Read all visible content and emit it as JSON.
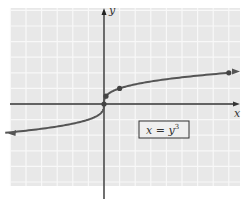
{
  "chart_data": {
    "type": "line",
    "title": "",
    "xlabel": "x",
    "ylabel": "y",
    "equation_label": "x = y³",
    "equation_lhs": "x = y",
    "equation_exp": "3",
    "grid": true,
    "xlim": [
      -6.3,
      8.6
    ],
    "ylim": [
      -5.3,
      6.1
    ],
    "series": [
      {
        "name": "x = y^3",
        "points": [
          {
            "x": 0,
            "y": 0
          },
          {
            "x": 0.125,
            "y": 0.5
          },
          {
            "x": 1,
            "y": 1
          },
          {
            "x": 8,
            "y": 2
          }
        ]
      }
    ],
    "colors": {
      "grid_bg": "#e8e8e8",
      "grid_line": "#f7f7f7",
      "curve": "#555555",
      "axis": "#222222"
    }
  }
}
